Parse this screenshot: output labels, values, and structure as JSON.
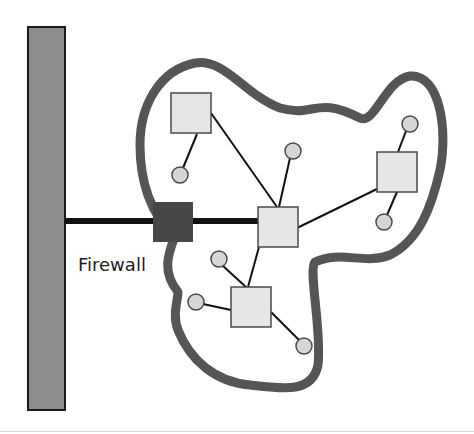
{
  "diagram": {
    "type": "network-firewall",
    "colors": {
      "backbone_fill": "#8c8c8c",
      "backbone_border": "#1a1a1a",
      "boundary_stroke": "#555555",
      "firewall_fill": "#474747",
      "node_fill": "#e6e6e6",
      "node_border": "#4a4a4a",
      "host_fill": "#d6d6d6",
      "link_color": "#111111"
    },
    "backbone": {
      "x": 28,
      "y": 27,
      "width": 37,
      "height": 383
    },
    "uplink": {
      "x1": 65,
      "y1": 221,
      "x2": 260,
      "y2": 221
    },
    "firewall": {
      "label": "Firewall",
      "x": 153,
      "y": 202,
      "size": 40,
      "label_x": 78,
      "label_y": 271
    },
    "boundary_path": "M178 292 C160 270, 170 250, 175 236 C150 215, 140 180, 140 145 C140 105, 160 70, 195 63 C225 58, 245 95, 280 108 C315 118, 315 95, 360 118 C375 125, 385 80, 410 76 C440 74, 448 130, 440 170 C432 205, 420 240, 390 255 C365 265, 340 250, 315 262 C308 270, 322 330, 318 365 C312 395, 280 388, 250 385 C215 382, 190 360, 178 330 C172 315, 178 300, 178 292 Z",
    "nodes": [
      {
        "id": "hub",
        "x": 258,
        "y": 207,
        "size": 40
      },
      {
        "id": "top-left",
        "x": 171,
        "y": 93,
        "size": 40
      },
      {
        "id": "right",
        "x": 377,
        "y": 152,
        "size": 40
      },
      {
        "id": "bottom",
        "x": 231,
        "y": 287,
        "size": 40
      }
    ],
    "hosts": [
      {
        "id": "h1",
        "cx": 180,
        "cy": 175,
        "r": 8
      },
      {
        "id": "h2",
        "cx": 293,
        "cy": 151,
        "r": 8
      },
      {
        "id": "h3",
        "cx": 410,
        "cy": 124,
        "r": 8
      },
      {
        "id": "h4",
        "cx": 384,
        "cy": 222,
        "r": 8
      },
      {
        "id": "h5",
        "cx": 219,
        "cy": 259,
        "r": 8
      },
      {
        "id": "h6",
        "cx": 196,
        "cy": 302,
        "r": 8
      },
      {
        "id": "h7",
        "cx": 304,
        "cy": 346,
        "r": 8
      }
    ],
    "links": [
      {
        "x1": 211,
        "y1": 113,
        "x2": 277,
        "y2": 207
      },
      {
        "x1": 197,
        "y1": 134,
        "x2": 183,
        "y2": 168
      },
      {
        "x1": 290,
        "y1": 158,
        "x2": 279,
        "y2": 207
      },
      {
        "x1": 297,
        "y1": 228,
        "x2": 377,
        "y2": 189
      },
      {
        "x1": 406,
        "y1": 131,
        "x2": 398,
        "y2": 152
      },
      {
        "x1": 397,
        "y1": 192,
        "x2": 387,
        "y2": 215
      },
      {
        "x1": 259,
        "y1": 247,
        "x2": 248,
        "y2": 287
      },
      {
        "x1": 223,
        "y1": 266,
        "x2": 246,
        "y2": 287
      },
      {
        "x1": 203,
        "y1": 304,
        "x2": 231,
        "y2": 310
      },
      {
        "x1": 271,
        "y1": 312,
        "x2": 299,
        "y2": 340
      }
    ]
  }
}
